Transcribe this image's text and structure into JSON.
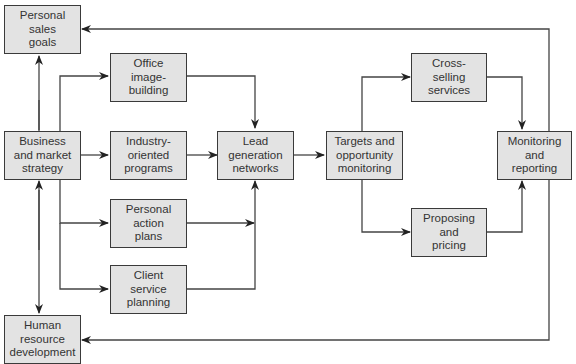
{
  "diagram": {
    "type": "flowchart",
    "colors": {
      "box_fill": "#e3e3e3",
      "box_border": "#3a3a3a",
      "line": "#444444",
      "text": "#333333"
    },
    "nodes": {
      "personal_sales_goals": "Personal\nsales\ngoals",
      "business_market_strategy": "Business\nand market\nstrategy",
      "human_resource_development": "Human\nresource\ndevelopment",
      "office_image_building": "Office\nimage-\nbuilding",
      "industry_oriented_programs": "Industry-\noriented\nprograms",
      "personal_action_plans": "Personal\naction\nplans",
      "client_service_planning": "Client\nservice\nplanning",
      "lead_generation_networks": "Lead\ngeneration\nnetworks",
      "targets_opportunity_monitoring": "Targets and\nopportunity\nmonitoring",
      "cross_selling_services": "Cross-\nselling\nservices",
      "proposing_pricing": "Proposing\nand\npricing",
      "monitoring_reporting": "Monitoring\nand\nreporting"
    },
    "edges": [
      [
        "business_market_strategy",
        "personal_sales_goals"
      ],
      [
        "business_market_strategy",
        "human_resource_development"
      ],
      [
        "business_market_strategy",
        "office_image_building"
      ],
      [
        "business_market_strategy",
        "industry_oriented_programs"
      ],
      [
        "business_market_strategy",
        "personal_action_plans"
      ],
      [
        "business_market_strategy",
        "client_service_planning"
      ],
      [
        "office_image_building",
        "lead_generation_networks"
      ],
      [
        "industry_oriented_programs",
        "lead_generation_networks"
      ],
      [
        "personal_action_plans",
        "lead_generation_networks"
      ],
      [
        "client_service_planning",
        "lead_generation_networks"
      ],
      [
        "lead_generation_networks",
        "targets_opportunity_monitoring"
      ],
      [
        "targets_opportunity_monitoring",
        "cross_selling_services"
      ],
      [
        "targets_opportunity_monitoring",
        "proposing_pricing"
      ],
      [
        "cross_selling_services",
        "monitoring_reporting"
      ],
      [
        "proposing_pricing",
        "monitoring_reporting"
      ],
      [
        "monitoring_reporting",
        "personal_sales_goals"
      ],
      [
        "monitoring_reporting",
        "human_resource_development"
      ]
    ]
  }
}
